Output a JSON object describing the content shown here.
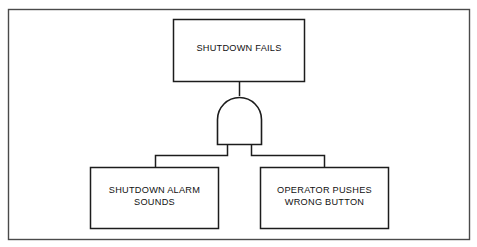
{
  "diagram": {
    "type": "fault-tree",
    "title": "",
    "frame": {
      "border_color": "#4a4a4a",
      "background_color": "#ffffff"
    },
    "stroke_color": "#1c1c1c",
    "top_event": {
      "label": "SHUTDOWN FAILS",
      "lines": [
        "SHUTDOWN FAILS"
      ]
    },
    "gate": {
      "kind": "AND",
      "label": "and-gate",
      "inputs": 2
    },
    "basic_events": [
      {
        "id": "left",
        "label": "SHUTDOWN ALARM SOUNDS",
        "lines": [
          "SHUTDOWN ALARM",
          "SOUNDS"
        ]
      },
      {
        "id": "right",
        "label": "OPERATOR PUSHES WRONG BUTTON",
        "lines": [
          "OPERATOR PUSHES",
          "WRONG BUTTON"
        ]
      }
    ]
  }
}
